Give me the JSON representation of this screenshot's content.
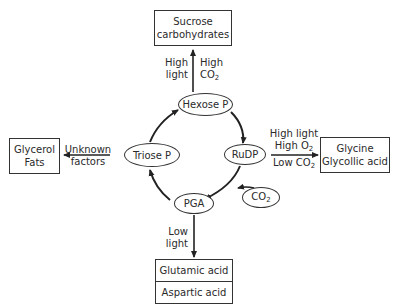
{
  "diagram": {
    "nodes": {
      "hexose_p": "Hexose P",
      "triose_p": "Triose P",
      "rudp": "RuDP",
      "pga": "PGA",
      "co2": "CO",
      "co2_sub": "2"
    },
    "products": {
      "sucrose": {
        "line1": "Sucrose",
        "line2": "carbohydrates"
      },
      "glycerol": {
        "line1": "Glycerol",
        "line2": "Fats"
      },
      "glycine": {
        "line1": "Glycine",
        "line2": "Glycollic acid"
      },
      "amino": {
        "line1": "Glutamic acid",
        "line2": "Aspartic acid"
      }
    },
    "conditions": {
      "sucrose_left": {
        "line1": "High",
        "line2": "light"
      },
      "sucrose_right": {
        "line1": "High",
        "line2": "CO",
        "sub": "2"
      },
      "glycerol": {
        "line1": "Unknown",
        "line2": "factors"
      },
      "glycine": {
        "line1": "High light",
        "line2": "High O",
        "line2_sub": "2",
        "line3": "Low CO",
        "line3_sub": "2"
      },
      "amino": {
        "line1": "Low",
        "line2": "light"
      }
    }
  }
}
